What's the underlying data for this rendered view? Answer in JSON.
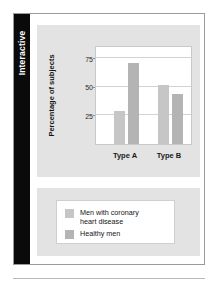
{
  "figure": {
    "side_tab_label": "Interactive"
  },
  "chart_data": {
    "type": "bar",
    "title": "",
    "xlabel": "",
    "ylabel": "Percentage of subjects",
    "categories": [
      "Type A",
      "Type B"
    ],
    "series": [
      {
        "name": "Men with coronary\nheart disease",
        "color": "#c6c6c6",
        "values": [
          29,
          52
        ]
      },
      {
        "name": "Healthy men",
        "color": "#b4b4b4",
        "values": [
          71,
          44
        ]
      }
    ],
    "ylim": [
      0,
      85
    ],
    "yticks": [
      25,
      50,
      75
    ],
    "ytick_labels": [
      "25",
      "50",
      "75"
    ],
    "grid": true,
    "legend_position": "below"
  },
  "legend": {
    "items": [
      {
        "label": "Men with coronary\nheart disease",
        "color": "#c6c6c6"
      },
      {
        "label": "Healthy men",
        "color": "#b4b4b4"
      }
    ]
  },
  "colors": {
    "panel_gray": "#e3e3e3",
    "tab_black": "#0a0a0a",
    "frame": "#9a9a9a",
    "bar_light": "#c6c6c6",
    "bar_dark": "#b4b4b4",
    "gridline": "#d2d2d2"
  }
}
